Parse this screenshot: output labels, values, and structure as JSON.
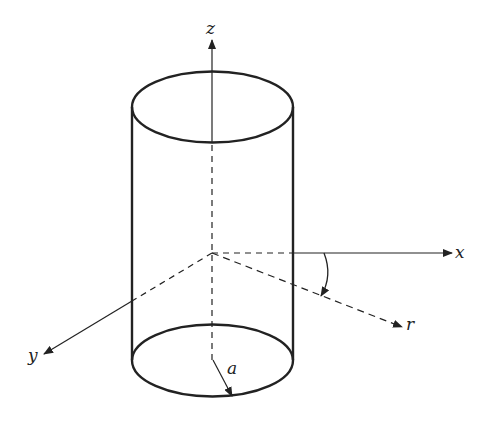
{
  "diagram": {
    "labels": {
      "z_axis": "z",
      "x_axis": "x",
      "y_axis": "y",
      "r_axis": "r",
      "radius": "a"
    },
    "colors": {
      "stroke": "#222222",
      "background": "#ffffff"
    }
  }
}
